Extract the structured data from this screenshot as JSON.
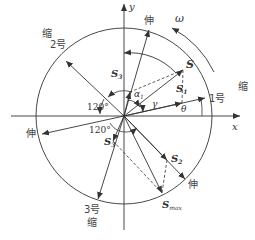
{
  "diagram": {
    "type": "vector-diagram",
    "colors": {
      "line": "#333333",
      "text": "#333333",
      "background": "#ffffff"
    },
    "axes": {
      "x_label": "x",
      "y_label": "y"
    },
    "rotation_label": "ω",
    "angles": {
      "theta": "θ",
      "gamma": "γ",
      "alpha": "α",
      "alpha_sub": "1",
      "upper_angle": "120°",
      "lower_angle": "120°"
    },
    "actuators": [
      {
        "id": "1",
        "label": "1号",
        "state_outer": "缩"
      },
      {
        "id": "2",
        "label": "2号",
        "state_outer": "缩"
      },
      {
        "id": "3",
        "label": "3号",
        "state_outer": "缩"
      }
    ],
    "extend_labels": {
      "top": "伸",
      "left": "伸",
      "bottom_right": "伸"
    },
    "retract_labels": {
      "right": "缩",
      "upper_left": "缩",
      "bottom": "缩"
    },
    "vectors": {
      "S": {
        "main": "S",
        "sub": ""
      },
      "S1": {
        "main": "S",
        "sub": "1"
      },
      "S2": {
        "main": "S",
        "sub": "2"
      },
      "S3_upper": {
        "main": "S",
        "sub": "3"
      },
      "S3_lower": {
        "main": "S",
        "sub": "3"
      },
      "Smax": {
        "main": "S",
        "sub": "max"
      }
    }
  }
}
